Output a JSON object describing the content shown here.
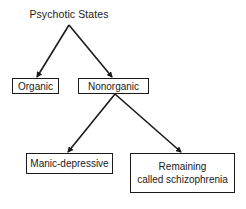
{
  "diagram": {
    "root": {
      "label": "Psychotic States"
    },
    "level1": [
      {
        "id": "organic",
        "label": "Organic"
      },
      {
        "id": "nonorganic",
        "label": "Nonorganic"
      }
    ],
    "level2": [
      {
        "id": "manic",
        "parent": "nonorganic",
        "label": "Manic-depressive"
      },
      {
        "id": "remaining",
        "parent": "nonorganic",
        "label_line1": "Remaining",
        "label_line2": "called schizophrenia"
      }
    ],
    "edges": [
      {
        "from": "Psychotic States",
        "to": "Organic"
      },
      {
        "from": "Psychotic States",
        "to": "Nonorganic"
      },
      {
        "from": "Nonorganic",
        "to": "Manic-depressive"
      },
      {
        "from": "Nonorganic",
        "to": "Remaining called schizophrenia"
      }
    ],
    "colors": {
      "line": "#1a1a1a",
      "background": "#ffffff"
    }
  }
}
